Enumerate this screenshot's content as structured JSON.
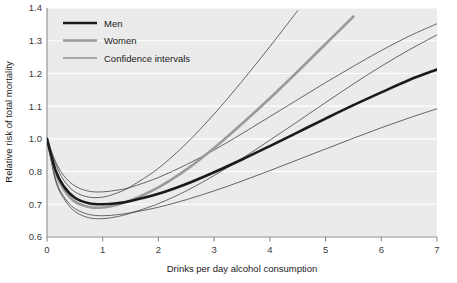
{
  "chart_data": {
    "type": "line",
    "title": "",
    "xlabel": "Drinks per day alcohol consumption",
    "ylabel": "Relative risk of total mortality",
    "xlim": [
      0,
      7
    ],
    "ylim": [
      0.6,
      1.4
    ],
    "xticks": [
      "0",
      "1",
      "2",
      "3",
      "4",
      "5",
      "6",
      "7"
    ],
    "xtick_values": [
      0,
      1,
      2,
      3,
      4,
      5,
      6,
      7
    ],
    "yticks": [
      "1.4",
      "1.3",
      "1.2",
      "1.1",
      "1.0",
      "0.8",
      "0.7",
      "0.6"
    ],
    "ytick_values": [
      1.4,
      1.3,
      1.2,
      1.1,
      1.0,
      0.9,
      0.8,
      0.7
    ],
    "grid": "horizontal-white",
    "legend_position": "top-left",
    "plot_background": "#ebebeb",
    "legend": [
      {
        "name": "Men",
        "style": "thick-black",
        "color": "#1a1a1a",
        "width": 2.6
      },
      {
        "name": "Women",
        "style": "thick-gray",
        "color": "#9a9a9a",
        "width": 2.6
      },
      {
        "name": "Confidence intervals",
        "style": "thin-black",
        "color": "#2b2b2b",
        "width": 0.7
      }
    ],
    "x": [
      0,
      0.15,
      0.3,
      0.5,
      0.75,
      1,
      1.25,
      1.5,
      2,
      2.5,
      3,
      3.5,
      4,
      4.5,
      5,
      5.5,
      6,
      6.5,
      7
    ],
    "series": [
      {
        "name": "Men",
        "color": "#1a1a1a",
        "values": [
          1.0,
          0.905,
          0.855,
          0.82,
          0.803,
          0.8,
          0.803,
          0.81,
          0.832,
          0.862,
          0.898,
          0.937,
          0.978,
          1.02,
          1.062,
          1.103,
          1.142,
          1.18,
          1.212
        ]
      },
      {
        "name": "Men CI upper",
        "color": "#2b2b2b",
        "values": [
          1.0,
          0.932,
          0.888,
          0.856,
          0.84,
          0.838,
          0.843,
          0.852,
          0.882,
          0.921,
          0.966,
          1.016,
          1.068,
          1.12,
          1.172,
          1.222,
          1.27,
          1.314,
          1.352
        ]
      },
      {
        "name": "Men CI lower",
        "color": "#2b2b2b",
        "values": [
          1.0,
          0.88,
          0.824,
          0.787,
          0.769,
          0.765,
          0.768,
          0.774,
          0.791,
          0.814,
          0.841,
          0.871,
          0.903,
          0.936,
          0.969,
          1.002,
          1.034,
          1.064,
          1.092
        ]
      },
      {
        "name": "Women",
        "color": "#9a9a9a",
        "values": [
          1.0,
          0.898,
          0.846,
          0.808,
          0.792,
          0.79,
          0.798,
          0.812,
          0.852,
          0.906,
          0.972,
          1.046,
          1.124,
          1.206,
          1.29,
          1.374,
          null,
          null,
          null
        ]
      },
      {
        "name": "Women CI upper",
        "color": "#2b2b2b",
        "values": [
          1.0,
          0.925,
          0.874,
          0.838,
          0.822,
          0.822,
          0.834,
          0.854,
          0.91,
          0.986,
          1.076,
          1.176,
          1.282,
          1.392,
          null,
          null,
          null,
          null,
          null
        ]
      },
      {
        "name": "Women CI lower",
        "color": "#2b2b2b",
        "values": [
          1.0,
          0.874,
          0.818,
          0.778,
          0.759,
          0.756,
          0.762,
          0.773,
          0.802,
          0.841,
          0.888,
          0.94,
          0.996,
          1.053,
          1.111,
          1.168,
          1.222,
          1.272,
          1.318
        ]
      }
    ]
  }
}
